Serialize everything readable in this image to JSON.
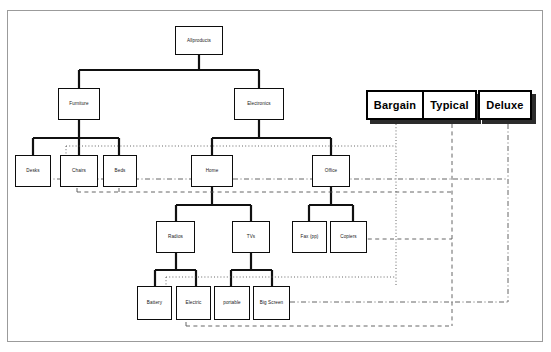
{
  "diagram": {
    "background_color": "#ffffff",
    "frame_border_color": "#9b9b9b",
    "node_border_color": "#0c0c0c",
    "category_border_color": "#000000",
    "category_shadow_color": "#2b2b2b",
    "connector_color": "#3a3a3a"
  },
  "tree": {
    "root": {
      "label": "Allproducts"
    },
    "level2": [
      {
        "label": "Furniture"
      },
      {
        "label": "Electronics"
      }
    ],
    "level3": [
      {
        "label": "Desks"
      },
      {
        "label": "Chairs"
      },
      {
        "label": "Beds"
      },
      {
        "label": "Home"
      },
      {
        "label": "Office"
      }
    ],
    "level4": [
      {
        "label": "Radios"
      },
      {
        "label": "TVs"
      },
      {
        "label": "Fax (pp)"
      },
      {
        "label": "Copiers"
      }
    ],
    "level5": [
      {
        "label": "Battery"
      },
      {
        "label": "Electric"
      },
      {
        "label": "portable"
      },
      {
        "label": "Big Screen"
      }
    ]
  },
  "categories": [
    {
      "label": "Bargain",
      "line_style": "dotted"
    },
    {
      "label": "Typical",
      "line_style": "dashed"
    },
    {
      "label": "Deluxe",
      "line_style": "dash-dot"
    }
  ]
}
